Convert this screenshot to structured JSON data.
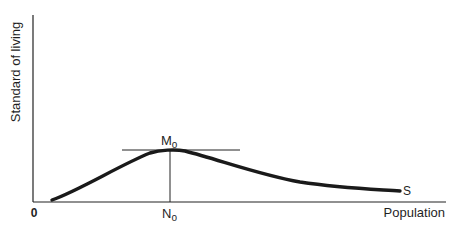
{
  "diagram": {
    "type": "economic-curve",
    "y_axis_label": "Standard of living",
    "x_axis_label": "Population",
    "origin_label": "0",
    "peak_label_main": "M",
    "peak_label_sub": "o",
    "peak_x_label_main": "N",
    "peak_x_label_sub": "o",
    "curve_end_label": "S",
    "colors": {
      "ink": "#1a1a1a",
      "background": "#ffffff"
    }
  }
}
